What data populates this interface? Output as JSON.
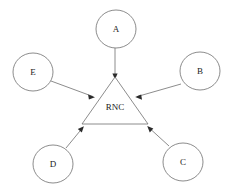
{
  "diagram": {
    "type": "star-topology-network-diagram",
    "background_color": "#ffffff",
    "stroke_color": "#6e6e6e",
    "arrow_color": "#2b2b2b",
    "label_color": "#1a1a1a",
    "hub": {
      "label": "RNC",
      "shape": "triangle",
      "apex": {
        "x": 115,
        "y": 77
      },
      "base_left": {
        "x": 82,
        "y": 124
      },
      "base_right": {
        "x": 148,
        "y": 124
      },
      "label_position": {
        "x": 115,
        "y": 107
      }
    },
    "nodes": [
      {
        "id": "A",
        "label": "A",
        "shape": "ellipse",
        "cx": 116,
        "cy": 29,
        "rx": 20,
        "ry": 19
      },
      {
        "id": "B",
        "label": "B",
        "shape": "ellipse",
        "cx": 200,
        "cy": 71,
        "rx": 20,
        "ry": 19
      },
      {
        "id": "C",
        "label": "C",
        "shape": "ellipse",
        "cx": 183,
        "cy": 162,
        "rx": 20,
        "ry": 19
      },
      {
        "id": "D",
        "label": "D",
        "shape": "ellipse",
        "cx": 53,
        "cy": 164,
        "rx": 20,
        "ry": 19
      },
      {
        "id": "E",
        "label": "E",
        "shape": "ellipse",
        "cx": 33,
        "cy": 72,
        "rx": 20,
        "ry": 19
      }
    ],
    "edges": [
      {
        "from": "A",
        "to": "RNC",
        "direction": "inward",
        "arrowhead": true,
        "start": {
          "x": 115,
          "y": 48
        },
        "end": {
          "x": 115,
          "y": 78
        }
      },
      {
        "from": "B",
        "to": "RNC",
        "direction": "inward",
        "arrowhead": true,
        "start": {
          "x": 181,
          "y": 84
        },
        "end": {
          "x": 136,
          "y": 97
        }
      },
      {
        "from": "C",
        "to": "RNC",
        "direction": "inward",
        "arrowhead": true,
        "start": {
          "x": 169,
          "y": 146
        },
        "end": {
          "x": 148,
          "y": 127
        }
      },
      {
        "from": "D",
        "to": "RNC",
        "direction": "inward",
        "arrowhead": true,
        "start": {
          "x": 66,
          "y": 148
        },
        "end": {
          "x": 83,
          "y": 127
        }
      },
      {
        "from": "E",
        "to": "RNC",
        "direction": "inward",
        "arrowhead": true,
        "start": {
          "x": 51,
          "y": 81
        },
        "end": {
          "x": 94,
          "y": 97
        }
      }
    ]
  }
}
